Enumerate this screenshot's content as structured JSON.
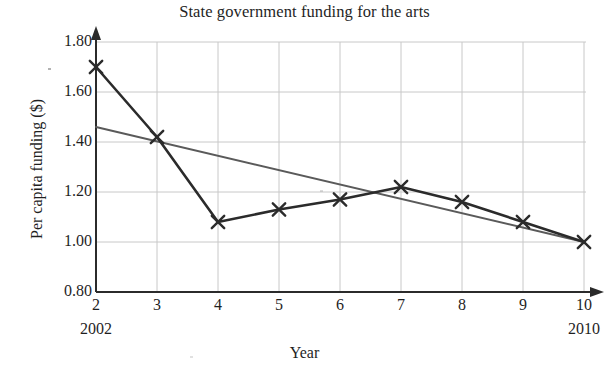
{
  "chart_data": {
    "type": "line",
    "title": "State government funding for the arts",
    "xlabel": "Year",
    "ylabel": "Per capita funding ($)",
    "x": [
      2,
      3,
      4,
      5,
      6,
      7,
      8,
      9,
      10
    ],
    "x_tick_labels": [
      "2",
      "3",
      "4",
      "5",
      "6",
      "7",
      "8",
      "9",
      "10"
    ],
    "x_year_labels": [
      {
        "x": 2,
        "label": "2002"
      },
      {
        "x": 10,
        "label": "2010"
      }
    ],
    "y_tick_labels": [
      "1.80",
      "1.60",
      "1.40",
      "1.20",
      "1.00",
      "0.80"
    ],
    "y_ticks": [
      1.8,
      1.6,
      1.4,
      1.2,
      1.0,
      0.8
    ],
    "xlim": [
      2,
      10
    ],
    "ylim": [
      0.8,
      1.8
    ],
    "grid": true,
    "legend": "none",
    "series": [
      {
        "name": "Per capita funding",
        "marker": "x",
        "color": "#2b2b2b",
        "values": [
          1.7,
          1.42,
          1.08,
          1.13,
          1.17,
          1.22,
          1.16,
          1.08,
          1.0
        ]
      },
      {
        "name": "Trend line",
        "marker": "none",
        "color": "#5a5a5a",
        "endpoints": [
          {
            "x": 2,
            "y": 1.46
          },
          {
            "x": 10,
            "y": 1.0
          }
        ]
      }
    ],
    "axis_color": "#2b2b2b",
    "grid_color": "#c8c8c8"
  }
}
